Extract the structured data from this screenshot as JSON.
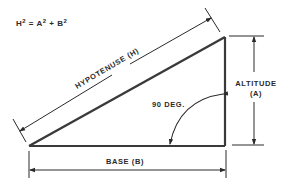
{
  "formula": {
    "h": "H",
    "h_exp": "2",
    "eq": " = ",
    "a": "A",
    "a_exp": "2",
    "plus": " + ",
    "b": "B",
    "b_exp": "2"
  },
  "labels": {
    "hypotenuse": "HYPOTENUSE (H)",
    "altitude_line1": "ALTITUDE",
    "altitude_line2": "(A)",
    "base": "BASE (B)",
    "angle": "90 DEG."
  },
  "colors": {
    "stroke": "#2a2a2a",
    "background": "#ffffff"
  },
  "geometry": {
    "vertex_base_left": [
      29,
      146
    ],
    "vertex_right_angle": [
      225,
      146
    ],
    "vertex_top": [
      225,
      37
    ]
  }
}
